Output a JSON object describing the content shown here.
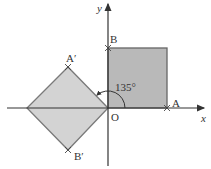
{
  "diagram": {
    "title": "",
    "type": "rotation-of-square",
    "axes": {
      "x_label": "x",
      "y_label": "y"
    },
    "origin_label": "O",
    "points": {
      "A": "A",
      "B": "B",
      "A_prime": "A′",
      "B_prime": "B′"
    },
    "angle_label": "135°",
    "colors": {
      "original_fill": "#b9b9b9",
      "image_fill": "#d3d3d3",
      "stroke": "#7a7a7a",
      "axis": "#333333"
    }
  }
}
